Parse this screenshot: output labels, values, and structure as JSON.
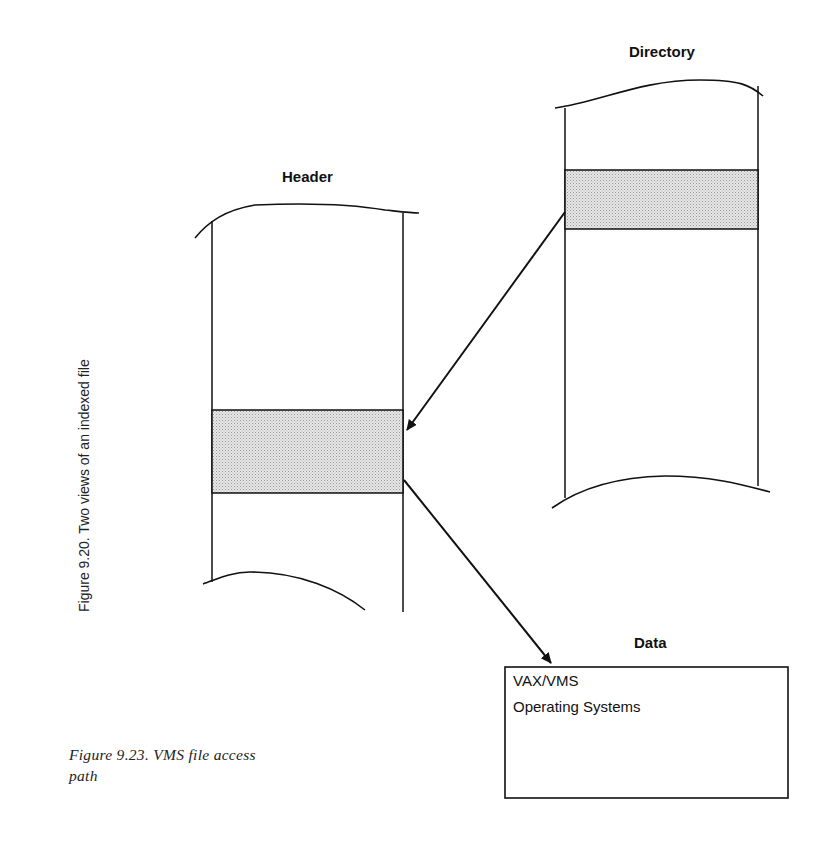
{
  "figure": {
    "rotated_caption": "Figure 9.20. Two views of an indexed file",
    "caption_line1": "Figure 9.23. VMS file access",
    "caption_line2": "path"
  },
  "nodes": {
    "directory": {
      "label": "Directory",
      "has_shaded_entry": true
    },
    "header": {
      "label": "Header",
      "has_shaded_entry": true
    },
    "data": {
      "label": "Data",
      "content_lines": [
        "VAX/VMS",
        "Operating Systems"
      ]
    }
  },
  "edges": [
    {
      "from": "directory.shaded_entry",
      "to": "header.shaded_entry"
    },
    {
      "from": "header.shaded_entry",
      "to": "data"
    }
  ],
  "colors": {
    "stroke": "#111111",
    "shade": "#d9d9d9",
    "background": "#ffffff"
  }
}
